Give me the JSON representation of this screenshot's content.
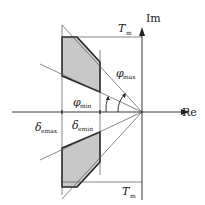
{
  "diagram": {
    "axes": {
      "imag_label": "Im",
      "real_label": "Re"
    },
    "labels": {
      "tm_top": "T",
      "tm_top_sub": "m",
      "tm_bottom": "T",
      "tm_bottom_sub": "m",
      "phi_max": "φ",
      "phi_max_sub": "max",
      "phi_min": "φ",
      "phi_min_sub": "min",
      "delta_emax": "δ",
      "delta_emax_sub": "emax",
      "delta_emin": "δ",
      "delta_emin_sub": "emin"
    },
    "colors": {
      "region_fill": "#c8c8c8",
      "line": "#222222",
      "thin_line": "#555555"
    }
  }
}
